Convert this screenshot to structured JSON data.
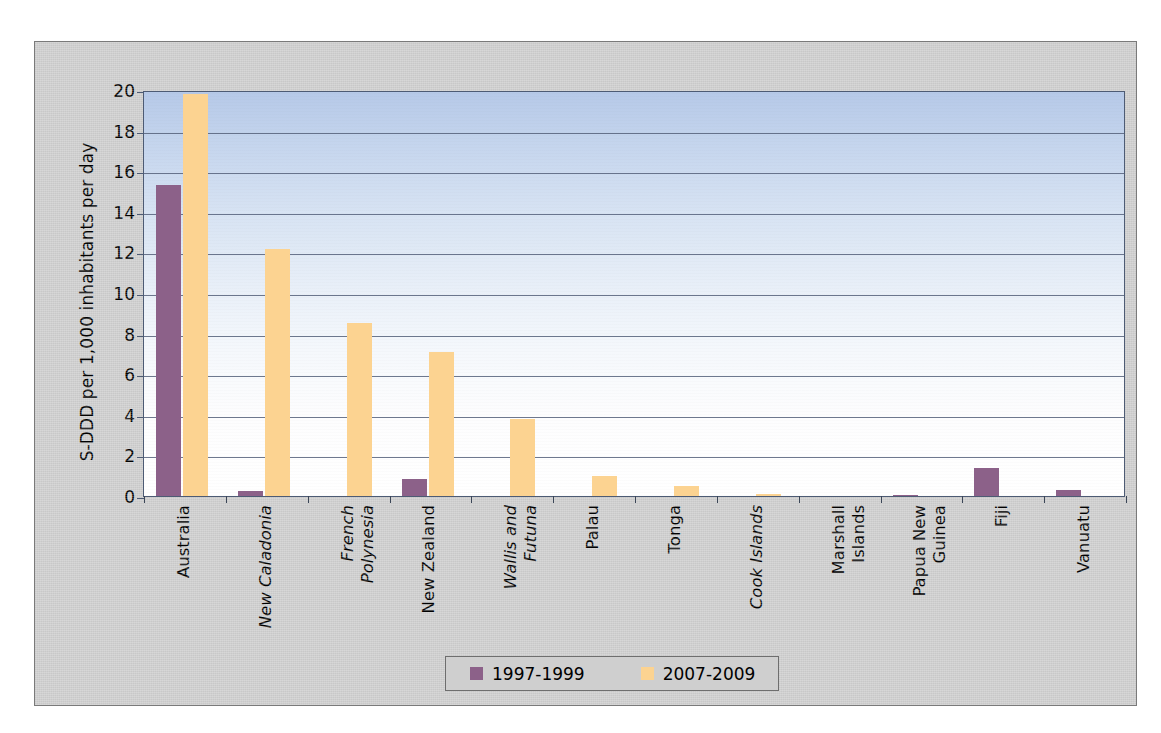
{
  "chart_data": {
    "type": "bar",
    "title": "",
    "xlabel": "",
    "ylabel": "S-DDD per 1,000 inhabitants per day",
    "ylim": [
      0,
      20
    ],
    "ytick_step": 2,
    "yticks": [
      "0",
      "2",
      "4",
      "6",
      "8",
      "10",
      "12",
      "14",
      "16",
      "18",
      "20"
    ],
    "grid": true,
    "legend_position": "bottom",
    "categories": [
      "Australia",
      "New Caladonia",
      "French Polynesia",
      "New Zealand",
      "Wallis and Futuna",
      "Palau",
      "Tonga",
      "Cook Islands",
      "Marshall Islands",
      "Papua New Guinea",
      "Fiji",
      "Vanuatu"
    ],
    "category_label_lines": [
      [
        "Australia"
      ],
      [
        "New Caladonia"
      ],
      [
        "French",
        "Polynesia"
      ],
      [
        "New Zealand"
      ],
      [
        "Wallis and",
        "Futuna"
      ],
      [
        "Palau"
      ],
      [
        "Tonga"
      ],
      [
        "Cook Islands"
      ],
      [
        "Marshall",
        "Islands"
      ],
      [
        "Papua New",
        "Guinea"
      ],
      [
        "Fiji"
      ],
      [
        "Vanuatu"
      ]
    ],
    "category_label_styles": [
      "normal",
      "italic",
      "italic",
      "normal",
      "italic",
      "normal",
      "normal",
      "italic",
      "normal",
      "normal",
      "normal",
      "normal"
    ],
    "series": [
      {
        "name": "1997-1999",
        "color": "#8c6189",
        "values": [
          15.3,
          0.25,
          0,
          0.85,
          0,
          0,
          0,
          0,
          0,
          0.07,
          1.4,
          0.3
        ]
      },
      {
        "name": "2007-2009",
        "color": "#fcd391",
        "values": [
          19.8,
          12.15,
          8.5,
          7.1,
          3.8,
          1.0,
          0.5,
          0.1,
          0,
          0,
          0,
          0
        ]
      }
    ]
  },
  "legend": {
    "items": [
      {
        "label": "1997-1999",
        "color": "#8c6189"
      },
      {
        "label": "2007-2009",
        "color": "#fcd391"
      }
    ]
  },
  "colors": {
    "series_1997_1999": "#8c6189",
    "series_2007_2009": "#fcd391",
    "plot_background_top": "#b6c9e8",
    "plot_background_bottom": "#ffffff",
    "frame_background": "#cfcfcf",
    "gridline": "#55607a",
    "axis": "#4d5b74"
  }
}
